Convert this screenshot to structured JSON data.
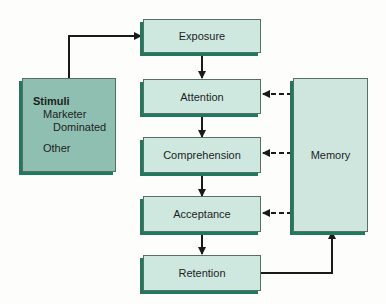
{
  "diagram": {
    "stimuli": {
      "title": "Stimuli",
      "line1": "Marketer",
      "line2": "Dominated",
      "line3": "Other"
    },
    "stages": [
      {
        "label": "Exposure"
      },
      {
        "label": "Attention"
      },
      {
        "label": "Comprehension"
      },
      {
        "label": "Acceptance"
      },
      {
        "label": "Retention"
      }
    ],
    "memory": {
      "label": "Memory"
    },
    "colors": {
      "stage_fill": "#cfe8df",
      "stimuli_fill": "#8fbfb0",
      "shadow": "#1d7a5f",
      "arrow": "#1a1a1a"
    }
  }
}
